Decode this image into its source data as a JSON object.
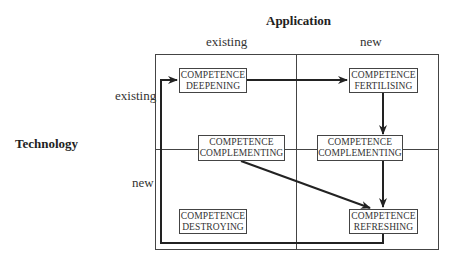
{
  "axes": {
    "x_title": "Application",
    "y_title": "Technology",
    "x_labels": [
      "existing",
      "new"
    ],
    "y_labels": [
      "existing",
      "new"
    ]
  },
  "boxes": {
    "deepening": {
      "line1": "COMPETENCE",
      "line2": "DEEPENING"
    },
    "fertilising": {
      "line1": "COMPETENCE",
      "line2": "FERTILISING"
    },
    "complementing_left": {
      "line1": "COMPETENCE",
      "line2": "COMPLEMENTING"
    },
    "complementing_right": {
      "line1": "COMPETENCE",
      "line2": "COMPLEMENTING"
    },
    "destroying": {
      "line1": "COMPETENCE",
      "line2": "DESTROYING"
    },
    "refreshing": {
      "line1": "COMPETENCE",
      "line2": "REFRESHING"
    }
  },
  "arrows": [
    {
      "from": "deepening",
      "to": "fertilising"
    },
    {
      "from": "fertilising",
      "to": "complementing_right"
    },
    {
      "from": "complementing_right",
      "to": "refreshing"
    },
    {
      "from": "complementing_left",
      "to": "refreshing"
    },
    {
      "from": "refreshing",
      "to": "deepening",
      "route": "loop-bottom-left"
    }
  ]
}
